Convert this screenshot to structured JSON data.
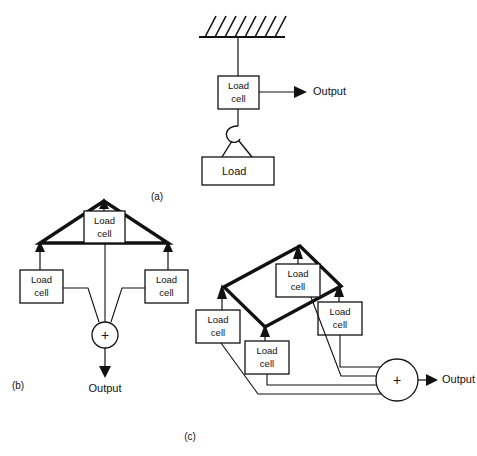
{
  "figure": {
    "ink_color": "#111111",
    "background_color": "#ffffff"
  },
  "labels": {
    "load_cell_line1": "Load",
    "load_cell_line2": "cell",
    "load": "Load",
    "output": "Output",
    "plus": "+",
    "part_a": "(a)",
    "part_b": "(b)",
    "part_c": "(c)"
  },
  "part_a": {
    "caption": "(a)",
    "support": "hatched-ceiling",
    "load_cell": {
      "line1": "Load",
      "line2": "cell"
    },
    "output": "Output",
    "load_box": "Load",
    "hook": "hook"
  },
  "part_b": {
    "caption": "(b)",
    "platform": "triangular",
    "cell_count": 3,
    "cells": [
      {
        "line1": "Load",
        "line2": "cell",
        "position": "apex"
      },
      {
        "line1": "Load",
        "line2": "cell",
        "position": "left"
      },
      {
        "line1": "Load",
        "line2": "cell",
        "position": "right"
      }
    ],
    "summing_junction": "+",
    "output": "Output"
  },
  "part_c": {
    "caption": "(c)",
    "platform": "rectangular-isometric",
    "cell_count": 4,
    "cells": [
      {
        "line1": "Load",
        "line2": "cell",
        "position": "top"
      },
      {
        "line1": "Load",
        "line2": "cell",
        "position": "left"
      },
      {
        "line1": "Load",
        "line2": "cell",
        "position": "bottom"
      },
      {
        "line1": "Load",
        "line2": "cell",
        "position": "right"
      }
    ],
    "summing_junction": "+",
    "output": "Output"
  }
}
